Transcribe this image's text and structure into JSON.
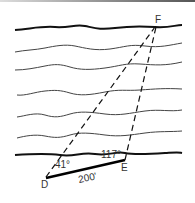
{
  "diagram": {
    "type": "surveying-triangle-across-river",
    "points": {
      "D": {
        "label": "D"
      },
      "E": {
        "label": "E"
      },
      "F": {
        "label": "F"
      }
    },
    "angles": {
      "at_D": "41°",
      "at_E": "117°"
    },
    "baseline": {
      "label": "200'"
    },
    "lines": {
      "top_bank": "thick",
      "bottom_bank": "thick",
      "water_lines": 5
    }
  }
}
